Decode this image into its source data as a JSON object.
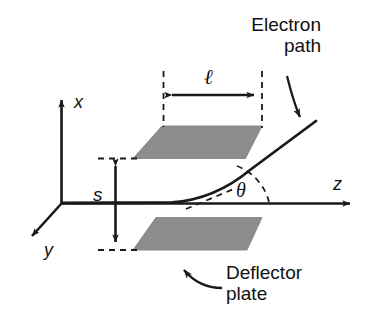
{
  "figure": {
    "background_color": "#ffffff",
    "line_color": "#1a1a1a",
    "plate_fill_color": "#8c8c8c",
    "width": 379,
    "height": 333
  },
  "axes": {
    "x_label": "x",
    "y_label": "y",
    "z_label": "z",
    "origin_label": ""
  },
  "annotations": {
    "electron_path": "Electron\npath",
    "deflector_plate": "Deflector\nplate",
    "gap_label": "s",
    "length_label": "ℓ",
    "angle_label": "θ"
  },
  "elements": {
    "top_plate_name": "top-deflector-plate",
    "bottom_plate_name": "bottom-deflector-plate",
    "path_name": "electron-path-curve",
    "gap_arrow_name": "gap-dimension-arrow",
    "length_arrow_name": "length-dimension-arrow",
    "angle_arc_name": "deflection-angle-arc"
  }
}
